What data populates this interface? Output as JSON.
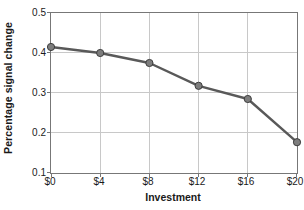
{
  "chart_data": {
    "type": "line",
    "title": "",
    "xlabel": "Investment",
    "ylabel": "Percentage signal change",
    "x": [
      0,
      4,
      8,
      12,
      16,
      20
    ],
    "xtick_labels": [
      "$0",
      "$4",
      "$8",
      "$12",
      "$16",
      "$20"
    ],
    "ytick_labels": [
      "0.5",
      "0.4",
      "0.3",
      "0.2",
      "0.1"
    ],
    "ytick_values": [
      0.5,
      0.4,
      0.3,
      0.2,
      0.1
    ],
    "values": [
      0.415,
      0.4,
      0.375,
      0.318,
      0.285,
      0.177
    ],
    "xlim": [
      0,
      20
    ],
    "ylim": [
      0.1,
      0.5
    ],
    "grid": true,
    "legend": "none",
    "series": [
      {
        "name": "Percentage signal change",
        "values": [
          0.415,
          0.4,
          0.375,
          0.318,
          0.285,
          0.177
        ]
      }
    ],
    "colors": {
      "line": "#595959",
      "marker_fill": "#7d7d7d",
      "marker_edge": "#3d3d3d",
      "grid": "#c8c8c8",
      "axis": "#777777",
      "text": "#1a1a1a"
    }
  }
}
